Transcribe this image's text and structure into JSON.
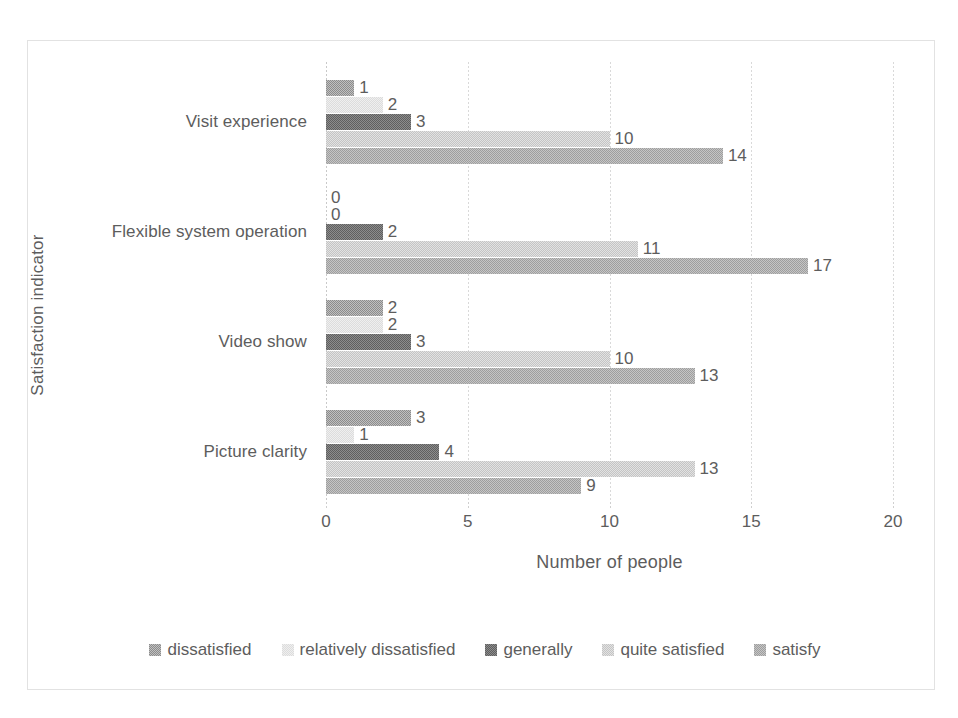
{
  "chart_data": {
    "type": "bar",
    "orientation": "horizontal",
    "title": "",
    "xlabel": "Number of people",
    "ylabel": "Satisfaction indicator",
    "xlim": [
      0,
      20
    ],
    "xticks": [
      0,
      5,
      10,
      15,
      20
    ],
    "xtick_labels": [
      "0",
      "5",
      "10",
      "15",
      "20"
    ],
    "grid": true,
    "legend_position": "bottom",
    "categories": [
      "Picture clarity",
      "Video show",
      "Flexible system operation",
      "Visit experience"
    ],
    "categories_top_to_bottom": [
      "Visit experience",
      "Flexible system operation",
      "Video show",
      "Picture clarity"
    ],
    "series": [
      {
        "name": "dissatisfied",
        "color": "#8c8c8c",
        "values": [
          3,
          2,
          0,
          1
        ]
      },
      {
        "name": "relatively dissatisfied",
        "color": "#dcdcdc",
        "values": [
          1,
          2,
          0,
          2
        ]
      },
      {
        "name": "generally",
        "color": "#5f5f5f",
        "values": [
          4,
          3,
          2,
          3
        ]
      },
      {
        "name": "quite satisfied",
        "color": "#c4c4c4",
        "values": [
          13,
          10,
          11,
          10
        ]
      },
      {
        "name": "satisfy",
        "color": "#9e9e9e",
        "values": [
          9,
          13,
          17,
          14
        ]
      }
    ],
    "groups": [
      {
        "category": "Visit experience",
        "bars": [
          {
            "series": "dissatisfied",
            "value": 1,
            "label": "1",
            "style": "s-dissatisfied"
          },
          {
            "series": "relatively dissatisfied",
            "value": 2,
            "label": "2",
            "style": "s-reldissatisfied"
          },
          {
            "series": "generally",
            "value": 3,
            "label": "3",
            "style": "s-generally"
          },
          {
            "series": "quite satisfied",
            "value": 10,
            "label": "10",
            "style": "s-quitesatisfied"
          },
          {
            "series": "satisfy",
            "value": 14,
            "label": "14",
            "style": "s-satisfy"
          }
        ]
      },
      {
        "category": "Flexible system operation",
        "bars": [
          {
            "series": "dissatisfied",
            "value": 0,
            "label": "0",
            "style": "s-dissatisfied"
          },
          {
            "series": "relatively dissatisfied",
            "value": 0,
            "label": "0",
            "style": "s-reldissatisfied"
          },
          {
            "series": "generally",
            "value": 2,
            "label": "2",
            "style": "s-generally"
          },
          {
            "series": "quite satisfied",
            "value": 11,
            "label": "11",
            "style": "s-quitesatisfied"
          },
          {
            "series": "satisfy",
            "value": 17,
            "label": "17",
            "style": "s-satisfy"
          }
        ]
      },
      {
        "category": "Video show",
        "bars": [
          {
            "series": "dissatisfied",
            "value": 2,
            "label": "2",
            "style": "s-dissatisfied"
          },
          {
            "series": "relatively dissatisfied",
            "value": 2,
            "label": "2",
            "style": "s-reldissatisfied"
          },
          {
            "series": "generally",
            "value": 3,
            "label": "3",
            "style": "s-generally"
          },
          {
            "series": "quite satisfied",
            "value": 10,
            "label": "10",
            "style": "s-quitesatisfied"
          },
          {
            "series": "satisfy",
            "value": 13,
            "label": "13",
            "style": "s-satisfy"
          }
        ]
      },
      {
        "category": "Picture clarity",
        "bars": [
          {
            "series": "dissatisfied",
            "value": 3,
            "label": "3",
            "style": "s-dissatisfied"
          },
          {
            "series": "relatively dissatisfied",
            "value": 1,
            "label": "1",
            "style": "s-reldissatisfied"
          },
          {
            "series": "generally",
            "value": 4,
            "label": "4",
            "style": "s-generally"
          },
          {
            "series": "quite satisfied",
            "value": 13,
            "label": "13",
            "style": "s-quitesatisfied"
          },
          {
            "series": "satisfy",
            "value": 9,
            "label": "9",
            "style": "s-satisfy"
          }
        ]
      }
    ],
    "legend": [
      {
        "label": "dissatisfied",
        "style": "s-dissatisfied"
      },
      {
        "label": "relatively dissatisfied",
        "style": "s-reldissatisfied"
      },
      {
        "label": "generally",
        "style": "s-generally"
      },
      {
        "label": "quite satisfied",
        "style": "s-quitesatisfied"
      },
      {
        "label": "satisfy",
        "style": "s-satisfy"
      }
    ]
  }
}
